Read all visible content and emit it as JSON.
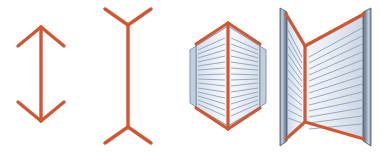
{
  "image": {
    "title": "Müller-Lyer illusion with book-perspective analogy",
    "width": 386,
    "height": 153,
    "background_color": "#ffffff"
  },
  "palette": {
    "line_red": "#cf5733",
    "line_red_dark": "#b4462a",
    "line_red_light": "#e0795a",
    "page_fill_light": "#eef2f7",
    "page_fill_mid": "#dce4ee",
    "page_fill_shadow": "#c3cfdf",
    "page_line": "#8ca0b9",
    "page_outline": "#7b8ca3",
    "cover_dark": "#5a6b80",
    "cover_mid": "#93a3b6",
    "cover_light": "#c9d3de"
  },
  "figures": [
    {
      "id": "fig-1",
      "name": "double-arrow-outward",
      "label": "Double-headed arrow with outward-pointing (convergent) fins",
      "shaft": {
        "x": 41,
        "y_top": 27,
        "y_bottom": 121
      },
      "fins": {
        "top_left_end": {
          "x": 18,
          "y": 46
        },
        "top_right_end": {
          "x": 64,
          "y": 46
        },
        "bottom_left_end": {
          "x": 18,
          "y": 102
        },
        "bottom_right_end": {
          "x": 64,
          "y": 102
        }
      },
      "stroke_width": 3.4
    },
    {
      "id": "fig-2",
      "name": "double-arrow-inward",
      "label": "Double-ended line with inward-pointing (divergent) fins",
      "shaft": {
        "x": 128,
        "y_top": 25,
        "y_bottom": 127
      },
      "fins": {
        "top_left_end": {
          "x": 105,
          "y": 9
        },
        "top_right_end": {
          "x": 151,
          "y": 9
        },
        "bottom_left_end": {
          "x": 105,
          "y": 143
        },
        "bottom_right_end": {
          "x": 151,
          "y": 143
        }
      },
      "stroke_width": 3.4
    },
    {
      "id": "fig-3",
      "name": "book-closing-edge-view",
      "label": "Book seen from its outer edge: covers folding away, spine nearest viewer",
      "spine": {
        "x": 228,
        "y_top": 23,
        "y_bottom": 129
      },
      "page_rows": 14,
      "stroke_width": 3.2
    },
    {
      "id": "fig-4",
      "name": "book-open-facing-view",
      "label": "Book seen open and facing the viewer: spine farthest away, covers toward viewer",
      "spine": {
        "x": 305,
        "y_top": 46,
        "y_bottom": 122
      },
      "page_rows": 16,
      "stroke_width": 3.2
    }
  ]
}
